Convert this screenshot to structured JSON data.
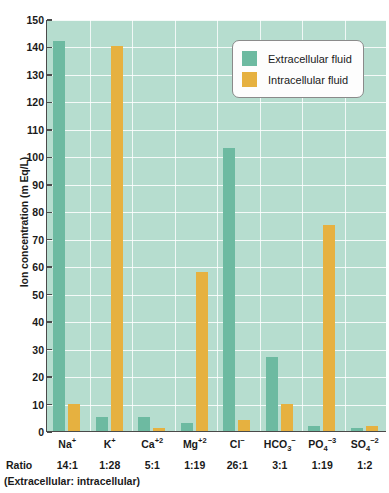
{
  "chart_data": {
    "type": "bar",
    "title": "",
    "xlabel": "",
    "ylabel": "Ion concentration (m Eq/L)",
    "ylim": [
      0,
      150
    ],
    "ytick_step": 10,
    "yticks": [
      0,
      10,
      20,
      30,
      40,
      50,
      60,
      70,
      80,
      90,
      100,
      110,
      120,
      130,
      140,
      150
    ],
    "grid": true,
    "legend_position": "top-right",
    "categories": [
      "Na+",
      "K+",
      "Ca+2",
      "Mg+2",
      "Cl-",
      "HCO3-",
      "PO4-3",
      "SO4-2"
    ],
    "category_labels": [
      {
        "base": "Na",
        "sup": "+",
        "sub": ""
      },
      {
        "base": "K",
        "sup": "+",
        "sub": ""
      },
      {
        "base": "Ca",
        "sup": "+2",
        "sub": ""
      },
      {
        "base": "Mg",
        "sup": "+2",
        "sub": ""
      },
      {
        "base": "Cl",
        "sup": "−",
        "sub": ""
      },
      {
        "base": "HCO",
        "sup": "−",
        "sub": "3"
      },
      {
        "base": "PO",
        "sup": "−3",
        "sub": "4"
      },
      {
        "base": "SO",
        "sup": "−2",
        "sub": "4"
      }
    ],
    "series": [
      {
        "name": "Extracellular fluid",
        "color": "#6dbaa1",
        "values": [
          142,
          5,
          5,
          3,
          103,
          27,
          2,
          1
        ]
      },
      {
        "name": "Intracellular fluid",
        "color": "#e6b140",
        "values": [
          10,
          140,
          1,
          58,
          4,
          10,
          75,
          2
        ]
      }
    ],
    "ratios": [
      "14:1",
      "1:28",
      "5:1",
      "1:19",
      "26:1",
      "3:1",
      "1:19",
      "1:2"
    ],
    "ratio_label": "Ratio",
    "ratio_caption": "(Extracellular: intracellular)",
    "plot_background": "#b6ddcf",
    "gridline_color": "#ffffff",
    "axis_color": "#4a4a4a"
  },
  "legend": {
    "items": [
      {
        "label": "Extracellular fluid",
        "color": "#6dbaa1"
      },
      {
        "label": "Intracellular fluid",
        "color": "#e6b140"
      }
    ]
  }
}
